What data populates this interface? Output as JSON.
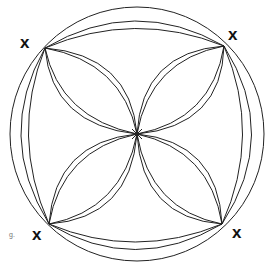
{
  "diagram": {
    "corner_marker": "x",
    "caption": "g.",
    "stroke_color": "#222222",
    "marks": [
      {
        "id": "top-left",
        "label": "x"
      },
      {
        "id": "top-right",
        "label": "x"
      },
      {
        "id": "bottom-left",
        "label": "x"
      },
      {
        "id": "bottom-right",
        "label": "x"
      }
    ]
  }
}
